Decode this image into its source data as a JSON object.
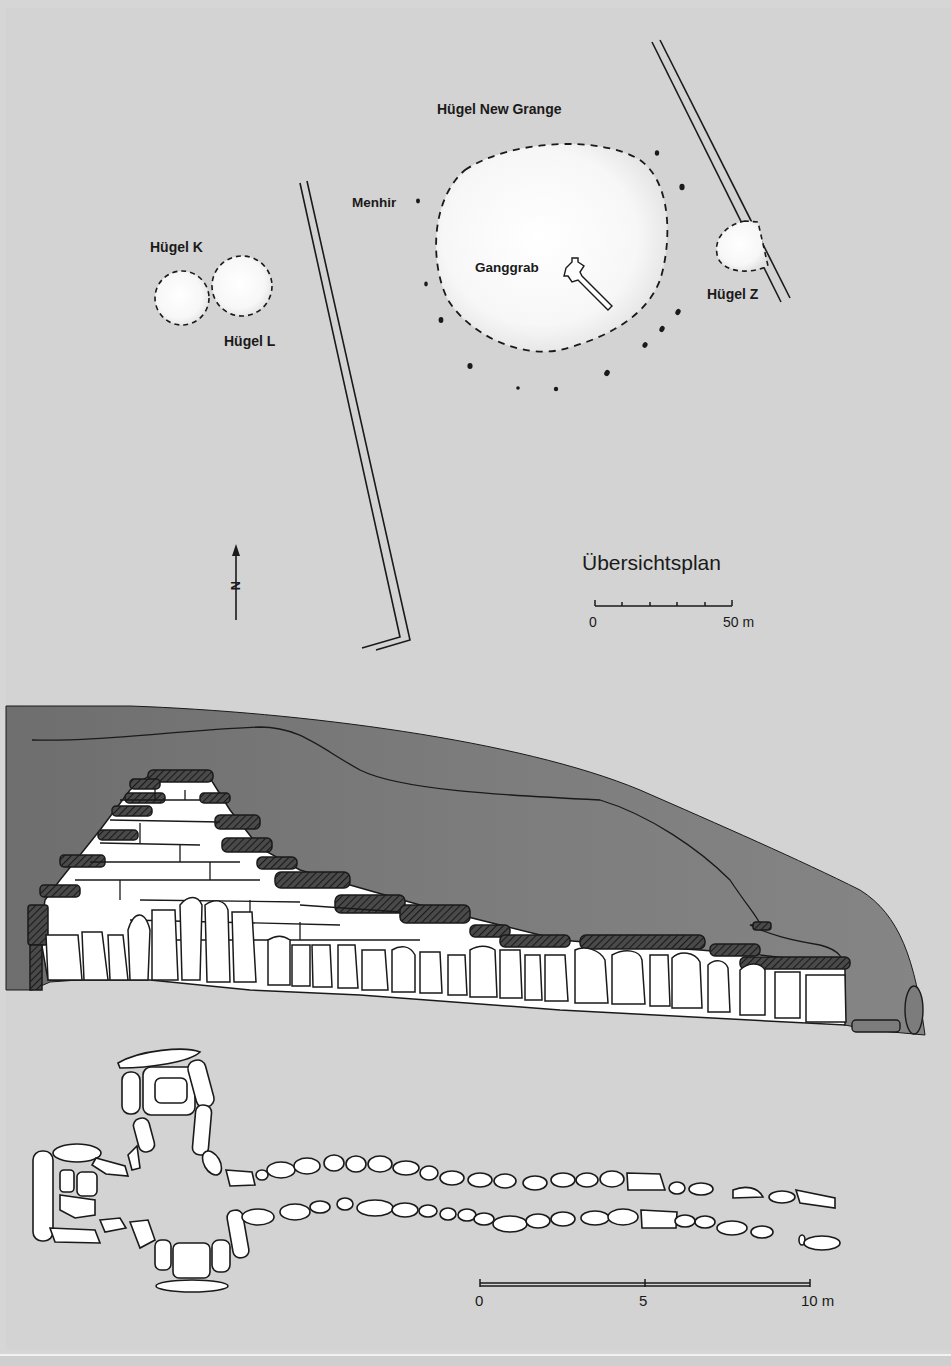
{
  "figure": {
    "background": "#d3d3d3",
    "mound_fill": "#7a7a7a",
    "stone_fill": "#ffffff",
    "line_color": "#1a1a1a"
  },
  "site_plan": {
    "title": "Übersichtsplan",
    "labels": {
      "main_mound": "Hügel New Grange",
      "menhir": "Menhir",
      "passage_grave": "Ganggrab",
      "mound_k": "Hügel K",
      "mound_l": "Hügel L",
      "mound_z": "Hügel Z"
    },
    "north_arrow": {
      "label": "N",
      "icon": "north-arrow-icon"
    },
    "scale_bar": {
      "start_label": "0",
      "end_label": "50 m",
      "ticks": 6
    }
  },
  "section": {
    "description": "Längsschnitt durch Ganggrab und Hügel"
  },
  "tomb_plan": {
    "scale_bar": {
      "start_label": "0",
      "mid_label": "5",
      "end_label": "10 m"
    }
  }
}
